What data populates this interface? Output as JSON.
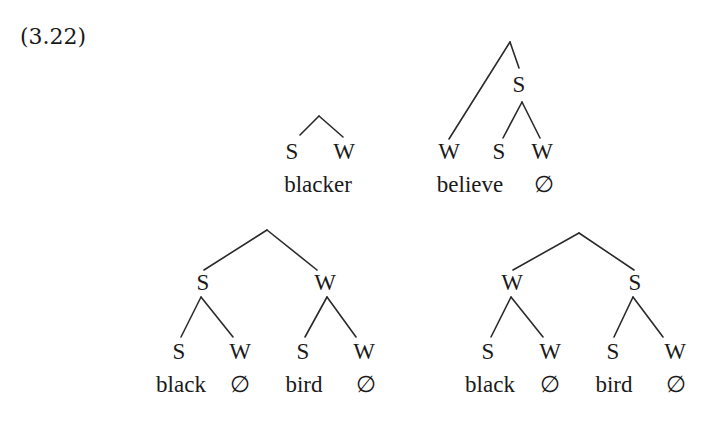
{
  "example_number": "(3.22)",
  "trees": [
    {
      "id": "blacker",
      "nodes": {
        "left": "S",
        "right": "W"
      },
      "words": {
        "main": "blacker"
      }
    },
    {
      "id": "believe",
      "nodes": {
        "left": "W",
        "inner": "S",
        "inner_left": "S",
        "inner_right": "W"
      },
      "words": {
        "main": "believe",
        "null": "∅"
      }
    },
    {
      "id": "black-bird-strong-weak",
      "nodes": {
        "left": "S",
        "right": "W",
        "ll": "S",
        "lr": "W",
        "rl": "S",
        "rr": "W"
      },
      "words": {
        "w1": "black",
        "n1": "∅",
        "w2": "bird",
        "n2": "∅"
      }
    },
    {
      "id": "black-bird-weak-strong",
      "nodes": {
        "left": "W",
        "right": "S",
        "ll": "S",
        "lr": "W",
        "rl": "S",
        "rr": "W"
      },
      "words": {
        "w1": "black",
        "n1": "∅",
        "w2": "bird",
        "n2": "∅"
      }
    }
  ]
}
